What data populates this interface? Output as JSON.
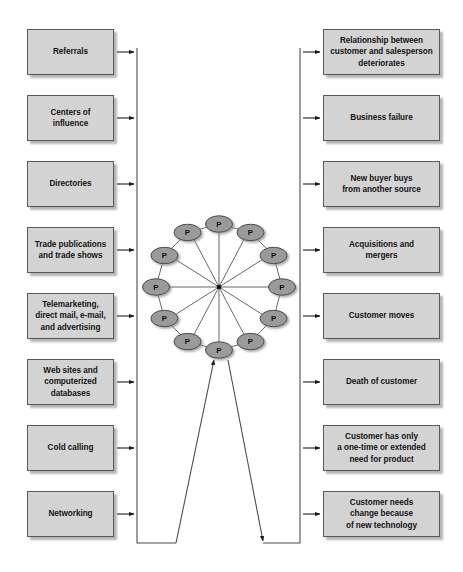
{
  "diagram": {
    "colors": {
      "box_fill": "#d3d3d3",
      "box_border": "#58585a",
      "node_fill": "#9a9a9a",
      "node_border": "#4a4a4a",
      "line": "#4d4d4d",
      "text": "#141414",
      "background": "#ffffff"
    },
    "left_column": {
      "name": "prospecting-sources",
      "boxes": [
        {
          "id": "referrals",
          "lines": [
            "Referrals"
          ]
        },
        {
          "id": "centers-of-influence",
          "lines": [
            "Centers of",
            "influence"
          ]
        },
        {
          "id": "directories",
          "lines": [
            "Directories"
          ]
        },
        {
          "id": "trade-publications",
          "lines": [
            "Trade publications",
            "and trade shows"
          ]
        },
        {
          "id": "telemarketing",
          "lines": [
            "Telemarketing,",
            "direct mail, e-mail,",
            "and advertising"
          ]
        },
        {
          "id": "web-sites",
          "lines": [
            "Web sites and",
            "computerized",
            "databases"
          ]
        },
        {
          "id": "cold-calling",
          "lines": [
            "Cold calling"
          ]
        },
        {
          "id": "networking",
          "lines": [
            "Networking"
          ]
        }
      ]
    },
    "right_column": {
      "name": "customer-loss-reasons",
      "boxes": [
        {
          "id": "relationship-deteriorates",
          "lines": [
            "Relationship between",
            "customer and salesperson",
            "deteriorates"
          ]
        },
        {
          "id": "business-failure",
          "lines": [
            "Business failure"
          ]
        },
        {
          "id": "new-buyer",
          "lines": [
            "New buyer buys",
            "from another source"
          ]
        },
        {
          "id": "acquisitions-mergers",
          "lines": [
            "Acquisitions and",
            "mergers"
          ]
        },
        {
          "id": "customer-moves",
          "lines": [
            "Customer moves"
          ]
        },
        {
          "id": "death-of-customer",
          "lines": [
            "Death of customer"
          ]
        },
        {
          "id": "one-time-need",
          "lines": [
            "Customer has only",
            "a one-time or extended",
            "need  for product"
          ]
        },
        {
          "id": "needs-change-technology",
          "lines": [
            "Customer needs",
            "change because",
            "of new technology"
          ]
        }
      ]
    },
    "wheel": {
      "name": "prospect-wheel",
      "node_label": "P",
      "node_count": 12,
      "center": {
        "x": 219,
        "y": 287
      },
      "radius": 63,
      "description": "Twelve prospect nodes arranged in a ring, each connected by spokes to a central hub and by rim segments to its neighbours."
    }
  }
}
